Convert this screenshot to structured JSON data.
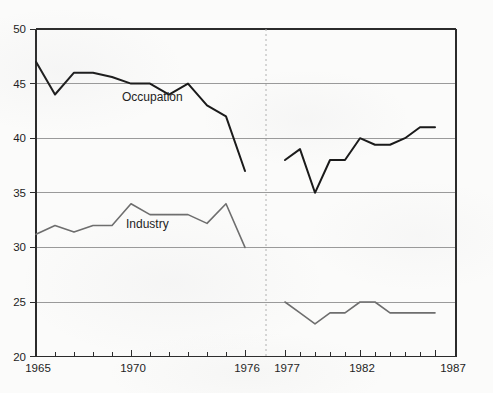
{
  "chart_data": {
    "type": "line",
    "title": "",
    "xlabel": "",
    "ylabel": "",
    "xlim": [
      1965,
      1987
    ],
    "ylim": [
      20,
      50
    ],
    "ytick_values": [
      20,
      25,
      30,
      35,
      40,
      45,
      50
    ],
    "ytick_labels": [
      "20",
      "25",
      "30",
      "35",
      "40",
      "45",
      "50"
    ],
    "xtick_values": [
      1965,
      1970,
      1976,
      1977,
      1982,
      1987
    ],
    "xtick_labels": [
      "1965",
      "1970",
      "1976",
      "1977",
      "1982",
      "1987"
    ],
    "xtick_minor_every": 1,
    "grid": "horizontal",
    "legend": "inline-annotations",
    "break_at": 1976.5,
    "break_style": "dotted-vertical",
    "series": [
      {
        "name": "Occupation",
        "segment": "left",
        "color": "#1a1a1a",
        "x": [
          1965,
          1966,
          1967,
          1968,
          1969,
          1970,
          1971,
          1972,
          1973,
          1974,
          1975,
          1976
        ],
        "values": [
          47,
          44,
          46,
          46,
          45.6,
          45,
          45,
          44,
          45,
          43,
          42,
          37
        ]
      },
      {
        "name": "Occupation",
        "segment": "right",
        "color": "#1a1a1a",
        "x": [
          1977,
          1978,
          1979,
          1980,
          1981,
          1982,
          1983,
          1984,
          1985,
          1986,
          1987
        ],
        "values": [
          38,
          39,
          35,
          38,
          38,
          40,
          39.4,
          39.4,
          40,
          41,
          41
        ]
      },
      {
        "name": "Industry",
        "segment": "left",
        "color": "#6e6e6e",
        "x": [
          1965,
          1966,
          1967,
          1968,
          1969,
          1970,
          1971,
          1972,
          1973,
          1974,
          1975,
          1976
        ],
        "values": [
          31.2,
          32,
          31.4,
          32,
          32,
          34,
          33,
          33,
          33,
          32.2,
          34,
          30
        ]
      },
      {
        "name": "Industry",
        "segment": "right",
        "color": "#6e6e6e",
        "x": [
          1977,
          1978,
          1979,
          1980,
          1981,
          1982,
          1983,
          1984,
          1985,
          1986,
          1987
        ],
        "values": [
          25,
          24,
          23,
          24,
          24,
          25,
          25,
          24,
          24,
          24,
          24
        ]
      }
    ],
    "annotations": [
      {
        "text": "Occupation",
        "x": 1970.3,
        "y": 43.2
      },
      {
        "text": "Industry",
        "x": 1970.2,
        "y": 32.4
      }
    ]
  },
  "axis": {
    "y_labels": [
      "50",
      "45",
      "40",
      "35",
      "30",
      "25",
      "20"
    ],
    "x_labels": [
      "1965",
      "1970",
      "1976",
      "1977",
      "1982",
      "1987"
    ]
  },
  "annotations": {
    "occupation_label": "Occupation",
    "industry_label": "Industry"
  },
  "colors": {
    "line_dark": "#1a1a1a",
    "line_gray": "#6e6e6e",
    "grid": "#9a9a9a",
    "frame": "#2b2b2b",
    "divider": "#b0b0b0",
    "text": "#1d1d1d",
    "background": "#fbfbfa"
  },
  "cropped_top_text": " "
}
